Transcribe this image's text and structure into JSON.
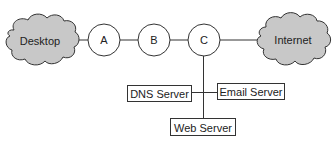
{
  "diagram": {
    "type": "network-topology",
    "colors": {
      "cloud_fill": "#c8c8c8",
      "stroke": "#333333",
      "node_fill": "#ffffff",
      "text": "#222222"
    },
    "clouds": [
      {
        "id": "desktop",
        "label": "Desktop"
      },
      {
        "id": "internet",
        "label": "Internet"
      }
    ],
    "nodes": [
      {
        "id": "A",
        "label": "A"
      },
      {
        "id": "B",
        "label": "B"
      },
      {
        "id": "C",
        "label": "C"
      }
    ],
    "servers": [
      {
        "id": "dns",
        "label": "DNS Server"
      },
      {
        "id": "email",
        "label": "Email Server"
      },
      {
        "id": "web",
        "label": "Web Server"
      }
    ],
    "edges": [
      {
        "from": "Desktop",
        "to": "A"
      },
      {
        "from": "A",
        "to": "B"
      },
      {
        "from": "B",
        "to": "C"
      },
      {
        "from": "C",
        "to": "Internet"
      },
      {
        "from": "C",
        "to": "Web Server"
      },
      {
        "from": "DNS Server",
        "to": "Email Server"
      }
    ]
  }
}
